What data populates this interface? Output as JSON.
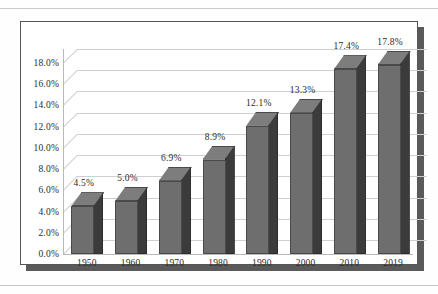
{
  "chart_data": {
    "type": "bar",
    "title": "",
    "subtitle": "",
    "xlabel": "",
    "ylabel": "",
    "categories": [
      "1950",
      "1960",
      "1970",
      "1980",
      "1990",
      "2000",
      "2010",
      "2019"
    ],
    "values": [
      4.5,
      5.0,
      6.9,
      8.9,
      12.1,
      13.3,
      17.4,
      17.8
    ],
    "data_labels": [
      "4.5%",
      "5.0%",
      "6.9%",
      "8.9%",
      "12.1%",
      "13.3%",
      "17.4%",
      "17.8%"
    ],
    "ylim": [
      0,
      18
    ],
    "ytick_values": [
      0,
      2,
      4,
      6,
      8,
      10,
      12,
      14,
      16,
      18
    ],
    "ytick_labels": [
      "0.0%",
      "2.0%",
      "4.0%",
      "6.0%",
      "8.0%",
      "10.0%",
      "12.0%",
      "14.0%",
      "16.0%",
      "18.0%"
    ],
    "grid": true,
    "legend": "none",
    "style": "3d-column",
    "series": [
      {
        "name": "",
        "values": [
          4.5,
          5.0,
          6.9,
          8.9,
          12.1,
          13.3,
          17.4,
          17.8
        ]
      }
    ]
  },
  "colors": {
    "bar_front": "#6e6e6e",
    "bar_side": "#3b3b3b",
    "bar_top": "#7d7d7d",
    "gridline": "#cfcfcf",
    "frame_border": "#555555",
    "frame_shadow": "#5a5a5a",
    "text": "#2b2b2b",
    "page_background": "#fefefe"
  }
}
